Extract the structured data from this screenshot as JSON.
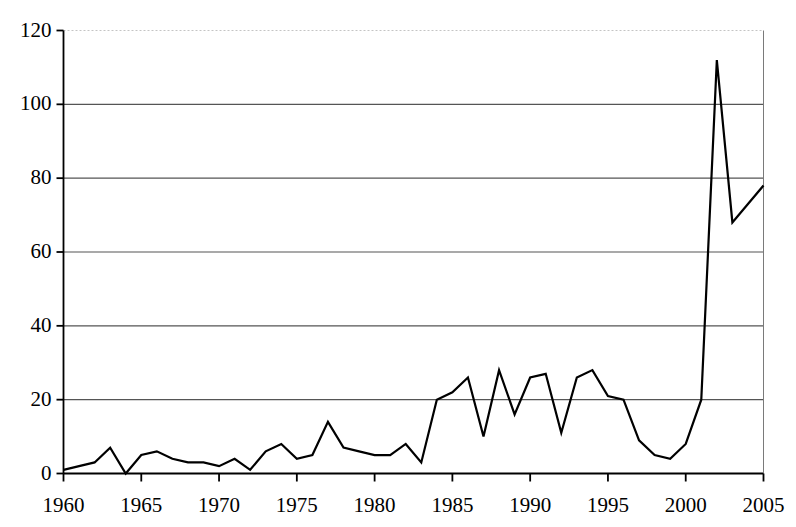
{
  "chart_data": {
    "type": "line",
    "title": "",
    "subtitle": "",
    "xlabel": "",
    "ylabel": "",
    "xlim": [
      1960,
      2005
    ],
    "ylim": [
      0,
      120
    ],
    "grid": true,
    "legend": null,
    "legend_position": "none",
    "line_color": "#000000",
    "gridline_color": "#555555",
    "axis_color": "#000000",
    "background_color": "#ffffff",
    "x_ticks": [
      1960,
      1965,
      1970,
      1975,
      1980,
      1985,
      1990,
      1995,
      2000,
      2005
    ],
    "x_tick_labels": [
      "1960",
      "1965",
      "1970",
      "1975",
      "1980",
      "1985",
      "1990",
      "1995",
      "2000",
      "2005"
    ],
    "y_ticks": [
      0,
      20,
      40,
      60,
      80,
      100,
      120
    ],
    "y_tick_labels": [
      "0",
      "20",
      "40",
      "60",
      "80",
      "100",
      "120"
    ],
    "x": [
      1960,
      1961,
      1962,
      1963,
      1964,
      1965,
      1966,
      1967,
      1968,
      1969,
      1970,
      1971,
      1972,
      1973,
      1974,
      1975,
      1976,
      1977,
      1978,
      1979,
      1980,
      1981,
      1982,
      1983,
      1984,
      1985,
      1986,
      1987,
      1988,
      1989,
      1990,
      1991,
      1992,
      1993,
      1994,
      1995,
      1996,
      1997,
      1998,
      1999,
      2000,
      2001,
      2002,
      2003,
      2004,
      2005
    ],
    "values": [
      1,
      2,
      3,
      7,
      0,
      5,
      6,
      4,
      3,
      3,
      2,
      4,
      1,
      6,
      8,
      4,
      5,
      14,
      7,
      6,
      5,
      5,
      8,
      3,
      20,
      22,
      26,
      10,
      28,
      16,
      26,
      27,
      11,
      26,
      28,
      21,
      20,
      9,
      5,
      4,
      8,
      20,
      112,
      68,
      73,
      78
    ],
    "series": [
      {
        "name": "series-1",
        "values": [
          1,
          2,
          3,
          7,
          0,
          5,
          6,
          4,
          3,
          3,
          2,
          4,
          1,
          6,
          8,
          4,
          5,
          14,
          7,
          6,
          5,
          5,
          8,
          3,
          20,
          22,
          26,
          10,
          28,
          16,
          26,
          27,
          11,
          26,
          28,
          21,
          20,
          9,
          5,
          4,
          8,
          20,
          112,
          68,
          73,
          78
        ]
      }
    ],
    "points": [
      {
        "year": 1960,
        "value": 1
      },
      {
        "year": 1961,
        "value": 2
      },
      {
        "year": 1962,
        "value": 3
      },
      {
        "year": 1963,
        "value": 7
      },
      {
        "year": 1964,
        "value": 0
      },
      {
        "year": 1965,
        "value": 5
      },
      {
        "year": 1966,
        "value": 6
      },
      {
        "year": 1967,
        "value": 4
      },
      {
        "year": 1968,
        "value": 3
      },
      {
        "year": 1969,
        "value": 3
      },
      {
        "year": 1970,
        "value": 2
      },
      {
        "year": 1971,
        "value": 4
      },
      {
        "year": 1972,
        "value": 1
      },
      {
        "year": 1973,
        "value": 6
      },
      {
        "year": 1974,
        "value": 8
      },
      {
        "year": 1975,
        "value": 4
      },
      {
        "year": 1976,
        "value": 5
      },
      {
        "year": 1977,
        "value": 14
      },
      {
        "year": 1978,
        "value": 7
      },
      {
        "year": 1979,
        "value": 6
      },
      {
        "year": 1980,
        "value": 5
      },
      {
        "year": 1981,
        "value": 5
      },
      {
        "year": 1982,
        "value": 8
      },
      {
        "year": 1983,
        "value": 3
      },
      {
        "year": 1984,
        "value": 20
      },
      {
        "year": 1985,
        "value": 22
      },
      {
        "year": 1986,
        "value": 26
      },
      {
        "year": 1987,
        "value": 10
      },
      {
        "year": 1988,
        "value": 28
      },
      {
        "year": 1989,
        "value": 16
      },
      {
        "year": 1990,
        "value": 26
      },
      {
        "year": 1991,
        "value": 27
      },
      {
        "year": 1992,
        "value": 11
      },
      {
        "year": 1993,
        "value": 26
      },
      {
        "year": 1994,
        "value": 28
      },
      {
        "year": 1995,
        "value": 21
      },
      {
        "year": 1996,
        "value": 20
      },
      {
        "year": 1997,
        "value": 9
      },
      {
        "year": 1998,
        "value": 5
      },
      {
        "year": 1999,
        "value": 4
      },
      {
        "year": 2000,
        "value": 8
      },
      {
        "year": 2001,
        "value": 20
      },
      {
        "year": 2002,
        "value": 112
      },
      {
        "year": 2003,
        "value": 68
      },
      {
        "year": 2004,
        "value": 73
      },
      {
        "year": 2005,
        "value": 78
      }
    ]
  }
}
